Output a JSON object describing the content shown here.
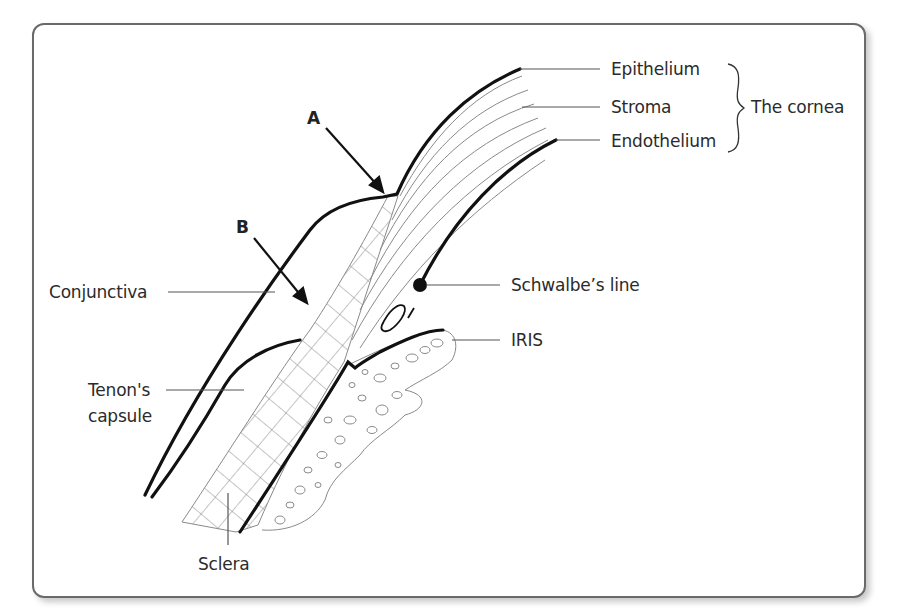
{
  "figure": {
    "labels": {
      "epithelium": "Epithelium",
      "stroma": "Stroma",
      "endothelium": "Endothelium",
      "cornea_group": "The cornea",
      "arrow_a": "A",
      "arrow_b": "B",
      "conjunctiva": "Conjunctiva",
      "schwalbes_line": "Schwalbe’s line",
      "iris": "IRIS",
      "tenons_capsule_line1": "Tenon's",
      "tenons_capsule_line2": "capsule",
      "sclera": "Sclera"
    },
    "colors": {
      "outline": "#111111",
      "leader": "#555555",
      "hatch": "#8a8a8a",
      "frame_border": "#6a6a6a"
    }
  }
}
